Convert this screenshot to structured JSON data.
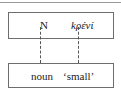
{
  "diagram": {
    "upper_box": {
      "left_label": "N",
      "right_label": "kρένί"
    },
    "lower_box": {
      "left_label": "noun",
      "right_label": "‘small’"
    },
    "connectors": [
      {
        "from": "N",
        "to": "noun",
        "style": "dashed"
      },
      {
        "from": "kρένί",
        "to": "‘small’",
        "style": "dashed"
      }
    ],
    "colors": {
      "border": "#6d6d6d",
      "text": "#222222",
      "background": "#ffffff"
    }
  }
}
